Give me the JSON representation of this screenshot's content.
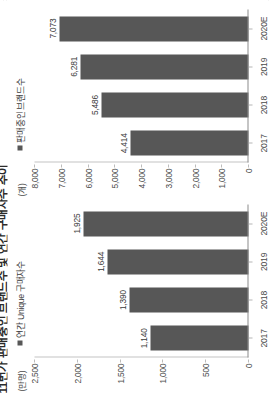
{
  "page": {
    "title_cropped": "11번가 판매중인 브랜드수 및 연간 구매자수 추이",
    "bar_color": "#575757",
    "axis_color": "#8c8c8c"
  },
  "chart_data": [
    {
      "type": "bar",
      "id": "unique-buyers",
      "title": "",
      "legend": "연간 Unique 구매자수",
      "ylabel": "(만명)",
      "xlabel": "",
      "categories": [
        "2017",
        "2018",
        "2019",
        "2020E"
      ],
      "values": [
        1140,
        1390,
        1644,
        1925
      ],
      "value_labels": [
        "1,140",
        "1,390",
        "1,644",
        "1,925"
      ],
      "yticks": [
        0,
        500,
        1000,
        1500,
        2000,
        2500
      ],
      "ytick_labels": [
        "0",
        "500",
        "1,000",
        "1,500",
        "2,000",
        "2,500"
      ],
      "ylim": [
        0,
        2500
      ],
      "grid": false,
      "legend_position": "top-left",
      "orientation": "vertical"
    },
    {
      "type": "bar",
      "id": "brands-on-sale",
      "title": "",
      "legend": "판매중인 브랜드수",
      "ylabel": "(개)",
      "xlabel": "",
      "categories": [
        "2017",
        "2018",
        "2019",
        "2020E"
      ],
      "values": [
        4414,
        5486,
        6281,
        7073
      ],
      "value_labels": [
        "4,414",
        "5,486",
        "6,281",
        "7,073"
      ],
      "yticks": [
        0,
        1000,
        2000,
        3000,
        4000,
        5000,
        6000,
        7000,
        8000
      ],
      "ytick_labels": [
        "0",
        "1,000",
        "2,000",
        "3,000",
        "4,000",
        "5,000",
        "6,000",
        "7,000",
        "8,000"
      ],
      "ylim": [
        0,
        8000
      ],
      "grid": false,
      "legend_position": "top-left",
      "orientation": "vertical"
    }
  ]
}
